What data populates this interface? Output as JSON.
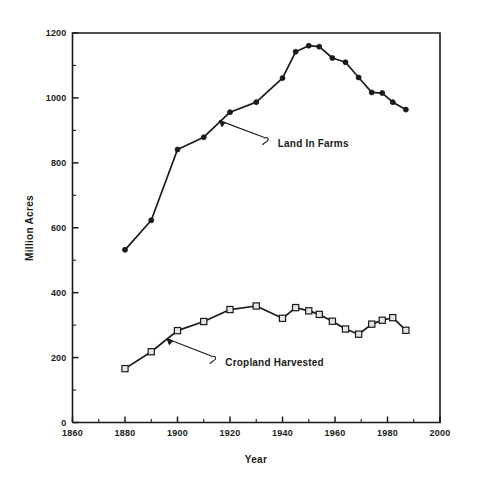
{
  "chart_data": {
    "type": "line",
    "title": "",
    "subtitle": "",
    "xlabel": "Year",
    "ylabel": "Million Acres",
    "xlim": [
      1860,
      2000
    ],
    "ylim": [
      0,
      1200
    ],
    "x_ticks": [
      1860,
      1880,
      1900,
      1920,
      1940,
      1960,
      1980,
      2000
    ],
    "x_tick_labels": [
      "1860",
      "1880",
      "1900",
      "1920",
      "1940",
      "1960",
      "1980",
      "2000"
    ],
    "x_minor_ticks": [
      1870,
      1890,
      1910,
      1930,
      1950,
      1970,
      1990
    ],
    "y_ticks": [
      0,
      200,
      400,
      600,
      800,
      1000,
      1200
    ],
    "y_tick_labels": [
      "0",
      "200",
      "400",
      "600",
      "800",
      "1000",
      "1200"
    ],
    "y_minor_ticks": [
      100,
      300,
      500,
      700,
      900,
      1100
    ],
    "grid": false,
    "legend_position": "inline-annotations",
    "series": [
      {
        "name": "Land In Farms",
        "marker": "filled-circle",
        "annotation_label": "Land In Farms",
        "points": [
          {
            "x": 1880,
            "y": 532
          },
          {
            "x": 1890,
            "y": 623
          },
          {
            "x": 1900,
            "y": 841
          },
          {
            "x": 1910,
            "y": 879
          },
          {
            "x": 1920,
            "y": 956
          },
          {
            "x": 1930,
            "y": 987
          },
          {
            "x": 1940,
            "y": 1061
          },
          {
            "x": 1945,
            "y": 1142
          },
          {
            "x": 1950,
            "y": 1161
          },
          {
            "x": 1954,
            "y": 1158
          },
          {
            "x": 1959,
            "y": 1123
          },
          {
            "x": 1964,
            "y": 1110
          },
          {
            "x": 1969,
            "y": 1063
          },
          {
            "x": 1974,
            "y": 1017
          },
          {
            "x": 1978,
            "y": 1015
          },
          {
            "x": 1982,
            "y": 987
          },
          {
            "x": 1987,
            "y": 964
          }
        ]
      },
      {
        "name": "Cropland Harvested",
        "marker": "open-square",
        "annotation_label": "Cropland Harvested",
        "points": [
          {
            "x": 1880,
            "y": 166
          },
          {
            "x": 1890,
            "y": 218
          },
          {
            "x": 1900,
            "y": 283
          },
          {
            "x": 1910,
            "y": 311
          },
          {
            "x": 1920,
            "y": 348
          },
          {
            "x": 1930,
            "y": 359
          },
          {
            "x": 1940,
            "y": 321
          },
          {
            "x": 1945,
            "y": 354
          },
          {
            "x": 1950,
            "y": 344
          },
          {
            "x": 1954,
            "y": 333
          },
          {
            "x": 1959,
            "y": 312
          },
          {
            "x": 1964,
            "y": 288
          },
          {
            "x": 1969,
            "y": 272
          },
          {
            "x": 1974,
            "y": 303
          },
          {
            "x": 1978,
            "y": 315
          },
          {
            "x": 1982,
            "y": 323
          },
          {
            "x": 1987,
            "y": 284
          }
        ]
      }
    ],
    "annotations": [
      {
        "text": "Land In Farms",
        "target": {
          "x": 1916,
          "y": 930
        },
        "label_at": {
          "x": 1934,
          "y": 882
        }
      },
      {
        "text": "Cropland Harvested",
        "target": {
          "x": 1896,
          "y": 258
        },
        "label_at": {
          "x": 1914,
          "y": 208
        }
      }
    ]
  }
}
